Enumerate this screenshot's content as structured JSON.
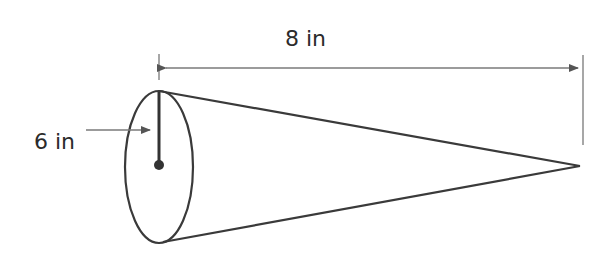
{
  "diagram": {
    "shape": "cone",
    "labels": {
      "length": "8 in",
      "radius": "6 in"
    },
    "colors": {
      "stroke": "#3a3a3a",
      "dimension": "#7a7a7a",
      "text": "#2b2b2b"
    }
  }
}
